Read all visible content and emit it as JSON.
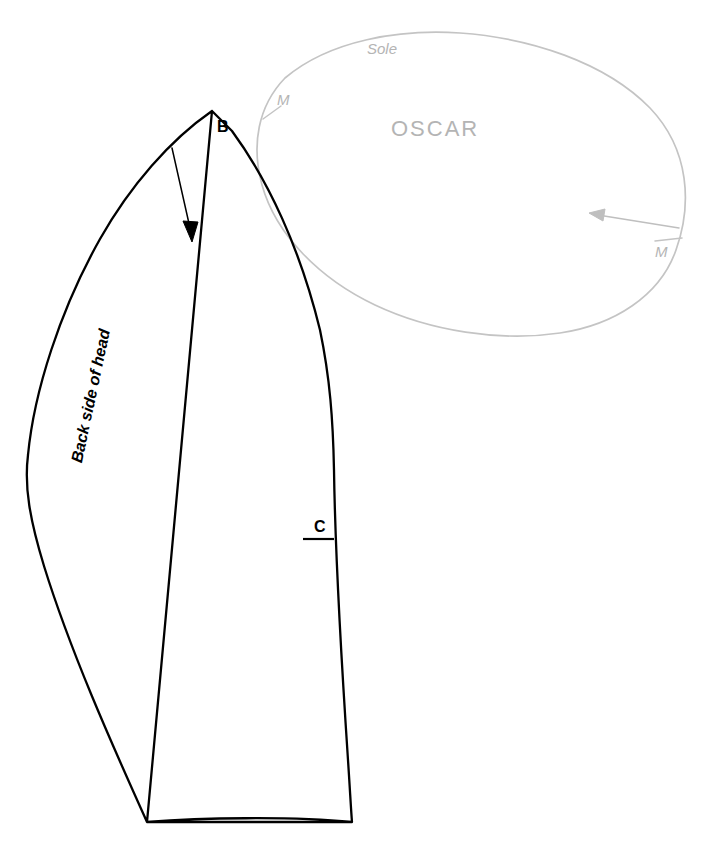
{
  "document": {
    "kind": "sewing-pattern-diagram",
    "background_color": "#ffffff",
    "width": 713,
    "height": 867
  },
  "pieces": {
    "head_panel": {
      "name": "Back side of head panel",
      "stroke_color": "#000000",
      "stroke_width": 2.2,
      "notch_labels": {
        "top": "B",
        "side": "C"
      },
      "edge_label": "Back side of head",
      "grainline_arrow": {
        "direction": "down-right",
        "color": "#000000"
      }
    },
    "sole": {
      "name": "Sole",
      "stroke_color": "#c4c4c4",
      "stroke_width": 1.6,
      "title": "Sole",
      "brand": "OSCAR",
      "mark_left": "M",
      "mark_right": "M",
      "grainline_arrow": {
        "direction": "left",
        "color": "#bfbfbf"
      }
    }
  },
  "labels": {
    "b": "B",
    "c": "C",
    "back_side_of_head": "Back side of head",
    "sole": "Sole",
    "oscar": "OSCAR",
    "m_left": "M",
    "m_right": "M"
  },
  "colors": {
    "ink_black": "#000000",
    "ink_gray": "#c4c4c4",
    "text_gray": "#b4b4b4",
    "paper": "#ffffff"
  }
}
